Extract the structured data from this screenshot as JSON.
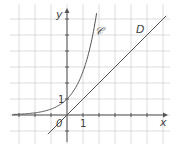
{
  "chart_data": {
    "type": "line",
    "title": "",
    "xlabel": "x",
    "ylabel": "y",
    "origin_label": "0",
    "x_tick_label": "1",
    "y_tick_label": "1",
    "xlim": [
      -3.4,
      6.2
    ],
    "ylim": [
      -1.6,
      6.5
    ],
    "grid": true,
    "series": [
      {
        "name": "𝒞",
        "function": "exp(x)",
        "x": [
          -3.4,
          -2,
          -1,
          0,
          1,
          1.5,
          1.85
        ],
        "y": [
          0.03,
          0.14,
          0.37,
          1,
          2.72,
          4.48,
          6.36
        ]
      },
      {
        "name": "D",
        "function": "x",
        "x": [
          -1.2,
          0,
          6.2
        ],
        "y": [
          -1.2,
          0,
          6.2
        ]
      }
    ],
    "annotations": [
      {
        "text": "𝒞",
        "x": 2.1,
        "y": 4.7
      },
      {
        "text": "D",
        "x": 4.5,
        "y": 4.8
      }
    ]
  },
  "colors": {
    "grid": "#dcdcdc",
    "axis": "#555555",
    "curve": "#555555"
  }
}
